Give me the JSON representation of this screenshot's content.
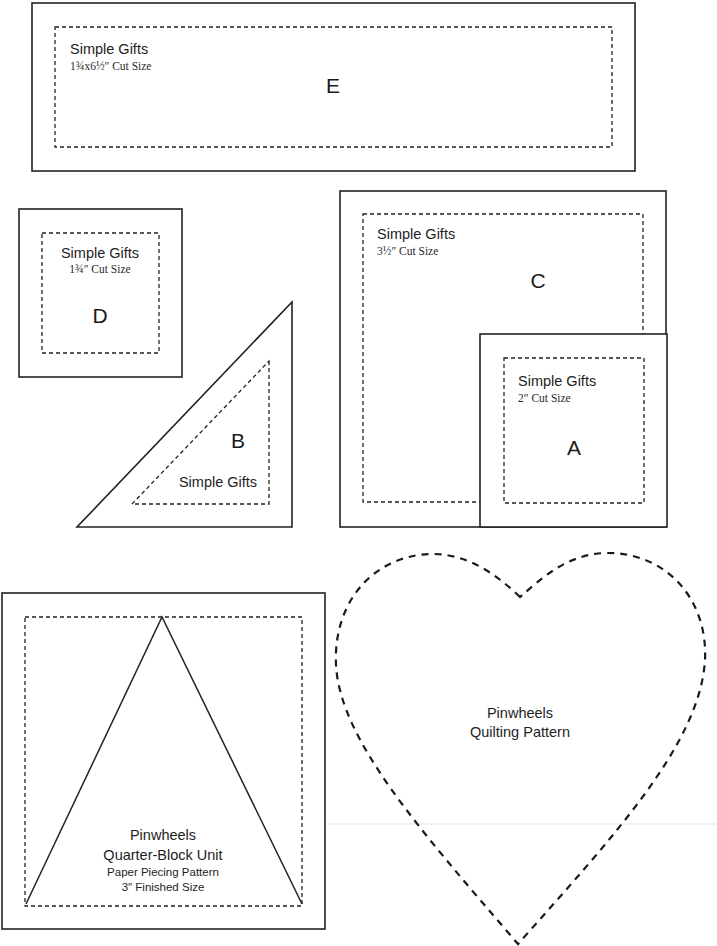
{
  "colors": {
    "ink": "#222222",
    "paper": "#ffffff"
  },
  "templates": {
    "E": {
      "letter": "E",
      "title": "Simple Gifts",
      "size": "1¾x6½″ Cut Size"
    },
    "D": {
      "letter": "D",
      "title": "Simple Gifts",
      "size": "1¾″ Cut Size"
    },
    "B": {
      "letter": "B",
      "title": "Simple Gifts"
    },
    "C": {
      "letter": "C",
      "title": "Simple Gifts",
      "size": "3½″ Cut Size"
    },
    "A": {
      "letter": "A",
      "title": "Simple Gifts",
      "size": "2″ Cut Size"
    },
    "pinwheel_unit": {
      "line1": "Pinwheels",
      "line2": "Quarter-Block Unit",
      "line3": "Paper Piecing Pattern",
      "line4": "3″ Finished Size"
    },
    "heart": {
      "line1": "Pinwheels",
      "line2": "Quilting Pattern"
    }
  }
}
